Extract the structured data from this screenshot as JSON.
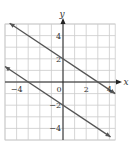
{
  "chart_data": {
    "type": "line",
    "title": "",
    "xlabel": "x",
    "ylabel": "y",
    "xlim": [
      -5,
      4.5
    ],
    "ylim": [
      -5,
      5
    ],
    "grid": true,
    "x_ticks": [
      -4,
      0,
      2,
      4
    ],
    "y_ticks": [
      4,
      2,
      -2,
      -4
    ],
    "x_tick_labels": [
      "−4",
      "0",
      "2",
      "4"
    ],
    "y_tick_labels": [
      "4",
      "2",
      "−2",
      "−4"
    ],
    "series": [
      {
        "name": "upper line",
        "equation": "y = -2/3 x + 2",
        "slope": -0.6667,
        "intercept": 2,
        "points": [
          [
            -4.6,
            5.07
          ],
          [
            0,
            2
          ],
          [
            3,
            0
          ],
          [
            4.5,
            -1
          ]
        ]
      },
      {
        "name": "lower line",
        "equation": "y = -2/3 x - 2",
        "slope": -0.6667,
        "intercept": -2,
        "points": [
          [
            -5,
            1.33
          ],
          [
            -3,
            0
          ],
          [
            0,
            -2
          ],
          [
            4.1,
            -4.73
          ]
        ]
      }
    ],
    "colors": {
      "grid": "#cccccc",
      "axis": "#222222",
      "line": "#555555"
    },
    "legend": null
  }
}
